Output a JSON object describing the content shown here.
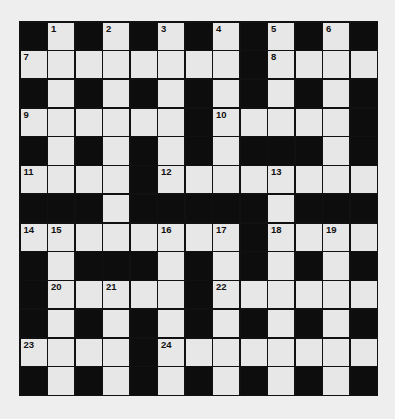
{
  "puzzle": {
    "title": "Crossword grid",
    "rows": 13,
    "cols": 13,
    "colors": {
      "background": "#eeeeee",
      "cell": "#e7e7e7",
      "block": "#0d0d0d",
      "line": "#111111"
    },
    "layout": [
      "#.#.#.#.#.#.#",
      "........#....",
      "#.#.#.#.#.#.#",
      "......#.....#",
      "#.#.#.#.###.#",
      "....#........",
      "###.#####.###",
      "........#....",
      "#.###.#.#.#.#",
      "#.....#......",
      "#.#.#.#.#.#.#",
      "....#........",
      "#.#.#.#.#.#.#"
    ],
    "numbers": [
      {
        "row": 0,
        "col": 1,
        "n": "1"
      },
      {
        "row": 0,
        "col": 3,
        "n": "2"
      },
      {
        "row": 0,
        "col": 5,
        "n": "3"
      },
      {
        "row": 0,
        "col": 7,
        "n": "4"
      },
      {
        "row": 0,
        "col": 9,
        "n": "5"
      },
      {
        "row": 0,
        "col": 11,
        "n": "6"
      },
      {
        "row": 1,
        "col": 0,
        "n": "7"
      },
      {
        "row": 1,
        "col": 9,
        "n": "8"
      },
      {
        "row": 3,
        "col": 0,
        "n": "9"
      },
      {
        "row": 3,
        "col": 7,
        "n": "10"
      },
      {
        "row": 5,
        "col": 0,
        "n": "11"
      },
      {
        "row": 5,
        "col": 5,
        "n": "12"
      },
      {
        "row": 5,
        "col": 9,
        "n": "13"
      },
      {
        "row": 7,
        "col": 0,
        "n": "14"
      },
      {
        "row": 7,
        "col": 1,
        "n": "15"
      },
      {
        "row": 7,
        "col": 5,
        "n": "16"
      },
      {
        "row": 7,
        "col": 7,
        "n": "17"
      },
      {
        "row": 7,
        "col": 9,
        "n": "18"
      },
      {
        "row": 7,
        "col": 11,
        "n": "19"
      },
      {
        "row": 9,
        "col": 1,
        "n": "20"
      },
      {
        "row": 9,
        "col": 3,
        "n": "21"
      },
      {
        "row": 9,
        "col": 7,
        "n": "22"
      },
      {
        "row": 11,
        "col": 0,
        "n": "23"
      },
      {
        "row": 11,
        "col": 5,
        "n": "24"
      }
    ]
  }
}
